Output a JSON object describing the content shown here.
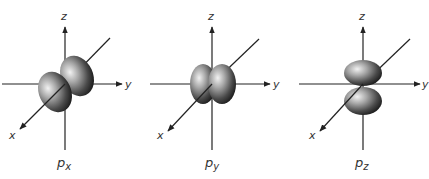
{
  "diagram": {
    "type": "p-orbital illustrations",
    "axes": {
      "x": "x",
      "y": "y",
      "z": "z"
    },
    "panels": [
      {
        "id": "px",
        "label_main": "p",
        "label_sub": "x",
        "lobe_axis": "x"
      },
      {
        "id": "py",
        "label_main": "p",
        "label_sub": "y",
        "lobe_axis": "y"
      },
      {
        "id": "pz",
        "label_main": "p",
        "label_sub": "z",
        "lobe_axis": "z"
      }
    ],
    "colors": {
      "axis": "#222222",
      "lobe_dark": "#2a2a2a",
      "lobe_light": "#e8e8e8"
    }
  }
}
